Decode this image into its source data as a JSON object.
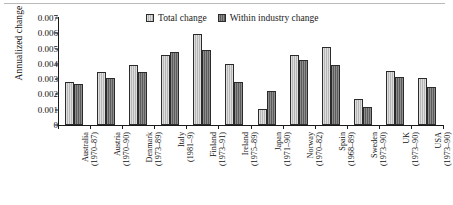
{
  "chart_data": {
    "type": "bar",
    "title": "",
    "xlabel": "",
    "ylabel": "Annualized change",
    "ylim": [
      0,
      0.007
    ],
    "ytick_labels": [
      "0",
      "0.001",
      "0.002",
      "0.003",
      "0.004",
      "0.005",
      "0.006",
      "0.007"
    ],
    "ytick_values": [
      0,
      0.001,
      0.002,
      0.003,
      0.004,
      0.005,
      0.006,
      0.007
    ],
    "grid": false,
    "legend_position": "top-center",
    "categories": [
      "Australia\n(1970–87)",
      "Austria\n(1970–90)",
      "Denmark\n(1973–89)",
      "Italy\n(1981–9)",
      "Finland\n(1973–91)",
      "Ireland\n(1975–89)",
      "Japan\n(1971–90)",
      "Norway\n(1970–82)",
      "Spain\n(1968–89)",
      "Sweden\n(1973–90)",
      "UK\n(1973–90)",
      "USA\n(1973–90)"
    ],
    "category_detail": [
      {
        "country": "Australia",
        "period": "(1970–87)"
      },
      {
        "country": "Austria",
        "period": "(1970–90)"
      },
      {
        "country": "Denmark",
        "period": "(1973–89)"
      },
      {
        "country": "Italy",
        "period": "(1981–9)"
      },
      {
        "country": "Finland",
        "period": "(1973–91)"
      },
      {
        "country": "Ireland",
        "period": "(1975–89)"
      },
      {
        "country": "Japan",
        "period": "(1971–90)"
      },
      {
        "country": "Norway",
        "period": "(1970–82)"
      },
      {
        "country": "Spain",
        "period": "(1968–89)"
      },
      {
        "country": "Sweden",
        "period": "(1973–90)"
      },
      {
        "country": "UK",
        "period": "(1973–90)"
      },
      {
        "country": "USA",
        "period": "(1973–90)"
      }
    ],
    "series": [
      {
        "name": "Total change",
        "color": "#b6b6b6",
        "values": [
          0.00283,
          0.0035,
          0.00393,
          0.00455,
          0.00595,
          0.004,
          0.00105,
          0.00458,
          0.00512,
          0.00172,
          0.00354,
          0.00308
        ]
      },
      {
        "name": "Within industry change",
        "color": "#5c5c5c",
        "values": [
          0.00267,
          0.0031,
          0.00348,
          0.00479,
          0.0049,
          0.00283,
          0.0022,
          0.00423,
          0.0039,
          0.0012,
          0.00317,
          0.00251
        ]
      }
    ]
  },
  "legend": {
    "items": [
      {
        "label": "Total change",
        "swatch": "total"
      },
      {
        "label": "Within industry change",
        "swatch": "within"
      }
    ]
  }
}
